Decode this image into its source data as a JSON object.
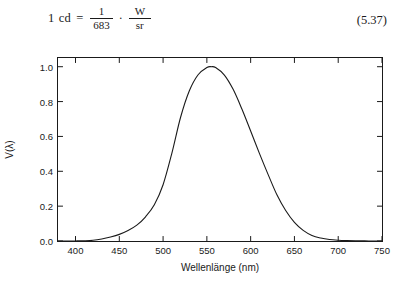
{
  "equation": {
    "lhs_value": "1",
    "lhs_unit": "cd",
    "relation": "=",
    "fraction_numerator": "1",
    "fraction_denominator": "683",
    "operator": "·",
    "unit_numerator": "W",
    "unit_denominator": "sr",
    "number": "(5.37)"
  },
  "figure": {
    "line_color": "#1a1a1a",
    "frame_color": "#1a1a1a",
    "background": "#ffffff"
  },
  "chart_data": {
    "type": "line",
    "title": "",
    "xlabel": "Wellenlänge (nm)",
    "ylabel": "V(λ)",
    "xlim": [
      380,
      750
    ],
    "ylim": [
      0.0,
      1.05
    ],
    "xticks": [
      400,
      450,
      500,
      550,
      600,
      650,
      700,
      750
    ],
    "xtick_labels": [
      "400",
      "450",
      "500",
      "550",
      "600",
      "650",
      "700",
      "750"
    ],
    "yticks": [
      0.0,
      0.2,
      0.4,
      0.6,
      0.8,
      1.0
    ],
    "ytick_labels": [
      "0.0",
      "0.2",
      "0.4",
      "0.6",
      "0.8",
      "1.0"
    ],
    "grid": false,
    "legend": null,
    "tick_direction": "in",
    "series": [
      {
        "name": "V(λ)",
        "peak_x": 555,
        "peak_y": 1.0,
        "x": [
          380,
          390,
          400,
          410,
          420,
          430,
          440,
          450,
          460,
          470,
          480,
          490,
          500,
          510,
          520,
          530,
          540,
          550,
          555,
          560,
          570,
          580,
          590,
          600,
          610,
          620,
          630,
          640,
          650,
          660,
          670,
          680,
          690,
          700,
          710,
          720,
          730,
          740,
          750
        ],
        "y": [
          0.0,
          0.001,
          0.004,
          0.012,
          0.04,
          0.116,
          0.23,
          0.38,
          0.6,
          0.91,
          1.39,
          2.08,
          3.23,
          5.03,
          7.1,
          8.62,
          9.54,
          9.95,
          10.0,
          9.95,
          9.52,
          8.7,
          7.57,
          6.31,
          5.03,
          3.81,
          2.65,
          1.75,
          1.07,
          0.61,
          0.32,
          0.17,
          0.082,
          0.041,
          0.021,
          0.01,
          0.005,
          0.003,
          0.001
        ],
        "y_scale_note": "y values listed as percent-of-peak times 10; normalized peak = 1.0"
      }
    ]
  }
}
